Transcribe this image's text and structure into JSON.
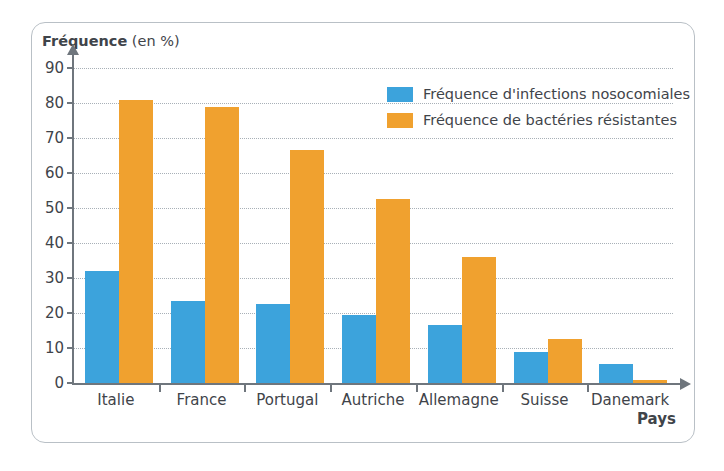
{
  "chart_data": {
    "type": "bar",
    "title": "Fréquence (en %)",
    "xlabel": "Pays",
    "ylabel": "Fréquence (en %)",
    "ylabel_bold_part": "Fréquence",
    "ylabel_rest": " (en %)",
    "ylim": [
      0,
      90
    ],
    "ytick_step": 10,
    "yticks": [
      90,
      80,
      70,
      60,
      50,
      40,
      30,
      20,
      10,
      0
    ],
    "grid": true,
    "legend_position": "top-right-inside",
    "categories": [
      "Italie",
      "France",
      "Portugal",
      "Autriche",
      "Allemagne",
      "Suisse",
      "Danemark"
    ],
    "series": [
      {
        "name": "Fréquence d'infections nosocomiales",
        "color": "#3ca3dc",
        "values": [
          32,
          23.5,
          22.5,
          19.5,
          16.5,
          9,
          5.5
        ]
      },
      {
        "name": "Fréquence de bactéries résistantes",
        "color": "#f0a12f",
        "values": [
          81,
          79,
          66.5,
          52.5,
          36,
          12.5,
          1
        ]
      }
    ]
  },
  "colors": {
    "series_blue": "#3ca3dc",
    "series_orange": "#f0a12f",
    "axis": "#6f767d",
    "grid": "#9aa3ab",
    "frame": "#b9c0c6",
    "text": "#3f444a"
  }
}
